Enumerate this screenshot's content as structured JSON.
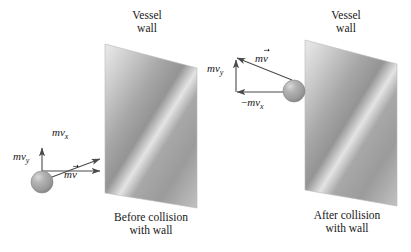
{
  "figure": {
    "width": 411,
    "height": 252,
    "background": "#ffffff",
    "ink_color": "#171717"
  },
  "panels": [
    {
      "id": "before",
      "wall_label_line1": "Vessel",
      "wall_label_line2": "wall",
      "caption_line1": "Before collision",
      "caption_line2": "with wall",
      "wall": {
        "top_left": [
          105,
          44
        ],
        "top_right": [
          197,
          68
        ],
        "bottom_right": [
          197,
          208
        ],
        "bottom_left": [
          105,
          193
        ],
        "fill_light": "#e2e2e2",
        "fill_mid": "#9a9a9a",
        "fill_dark": "#8c8c8c",
        "shine": "#e8e8e8"
      },
      "ball": {
        "cx": 42,
        "cy": 182,
        "r": 11,
        "fill": "#9d9d9d",
        "highlight": "#d8d8d8"
      },
      "vectors": [
        {
          "name": "mvx",
          "label_m": "m",
          "label_v": "v",
          "label_sub": "x",
          "label_sign": "",
          "has_overarrow": false,
          "from": [
            42,
            171
          ],
          "to": [
            103,
            171
          ],
          "label_pos": [
            52,
            126
          ]
        },
        {
          "name": "mvy",
          "label_m": "m",
          "label_v": "v",
          "label_sub": "y",
          "label_sign": "",
          "has_overarrow": false,
          "from": [
            42,
            182
          ],
          "to": [
            42,
            145
          ],
          "label_pos": [
            13,
            150
          ]
        },
        {
          "name": "mv",
          "label_m": "m",
          "label_v": "v",
          "label_sub": "",
          "label_sign": "",
          "has_overarrow": true,
          "from": [
            42,
            182
          ],
          "to": [
            103,
            157
          ],
          "label_pos": [
            64,
            168
          ]
        }
      ]
    },
    {
      "id": "after",
      "wall_label_line1": "Vessel",
      "wall_label_line2": "wall",
      "caption_line1": "After collision",
      "caption_line2": "with wall",
      "wall": {
        "top_left": [
          305,
          40
        ],
        "top_right": [
          397,
          64
        ],
        "bottom_right": [
          397,
          206
        ],
        "bottom_left": [
          305,
          190
        ],
        "fill_light": "#e2e2e2",
        "fill_mid": "#9a9a9a",
        "fill_dark": "#8c8c8c",
        "shine": "#e8e8e8"
      },
      "ball": {
        "cx": 294,
        "cy": 91,
        "r": 11,
        "fill": "#9d9d9d",
        "highlight": "#d8d8d8"
      },
      "vectors": [
        {
          "name": "mvy",
          "label_m": "m",
          "label_v": "v",
          "label_sub": "y",
          "label_sign": "",
          "has_overarrow": false,
          "from": [
            236,
            92
          ],
          "to": [
            236,
            57
          ],
          "label_pos": [
            208,
            62
          ]
        },
        {
          "name": "mv",
          "label_m": "m",
          "label_v": "v",
          "label_sub": "",
          "label_sign": "",
          "has_overarrow": true,
          "from": [
            294,
            80
          ],
          "to": [
            234,
            55
          ],
          "label_pos": [
            255,
            52
          ]
        },
        {
          "name": "minus-mvx",
          "label_m": "m",
          "label_v": "v",
          "label_sub": "x",
          "label_sign": "−",
          "has_overarrow": false,
          "from": [
            292,
            92
          ],
          "to": [
            234,
            92
          ],
          "label_pos": [
            243,
            96
          ]
        }
      ]
    }
  ],
  "text_positions": {
    "before_wall_label": [
      132,
      10
    ],
    "before_caption": [
      112,
      212
    ],
    "after_wall_label": [
      328,
      10
    ],
    "after_caption": [
      307,
      210
    ]
  }
}
